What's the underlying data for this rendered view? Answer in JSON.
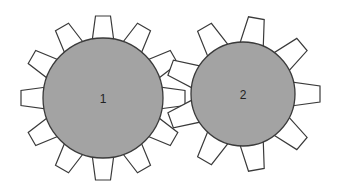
{
  "diagram": {
    "type": "meshing-gears",
    "background": "#ffffff",
    "gears": [
      {
        "id": "gear-1",
        "label": "1",
        "center": [
          103,
          98
        ],
        "radius": 60,
        "tooth_count": 12,
        "tooth_start_angle_deg": 0,
        "tooth_inner_radius": 56,
        "tooth_outer_radius": 82,
        "tooth_base_half_width": 11,
        "tooth_tip_half_width": 7.5,
        "fill": "#a3a3a3",
        "tooth_fill": "#ffffff",
        "stroke": "#3a3a3a"
      },
      {
        "id": "gear-2",
        "label": "2",
        "center": [
          243,
          94
        ],
        "radius": 52,
        "tooth_count": 9,
        "tooth_start_angle_deg": 0,
        "tooth_inner_radius": 48,
        "tooth_outer_radius": 77,
        "tooth_base_half_width": 12,
        "tooth_tip_half_width": 8,
        "fill": "#a3a3a3",
        "tooth_fill": "#ffffff",
        "stroke": "#3a3a3a"
      }
    ]
  }
}
